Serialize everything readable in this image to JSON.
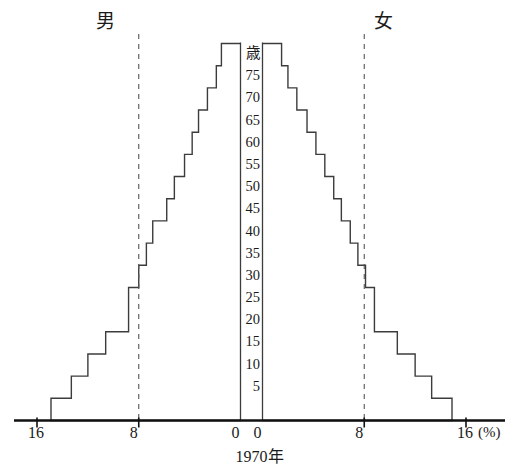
{
  "header": {
    "male_label": "男",
    "female_label": "女"
  },
  "axis": {
    "age_unit_label": "歳",
    "percent_unit_label": "(%)",
    "x_title": "1970年",
    "age_ticks": [
      "歳",
      "75",
      "70",
      "65",
      "60",
      "55",
      "50",
      "45",
      "40",
      "35",
      "30",
      "25",
      "20",
      "15",
      "10",
      "5"
    ],
    "x_tick_labels_left": [
      "16",
      "8",
      "0"
    ],
    "x_tick_labels_right": [
      "0",
      "8",
      "16"
    ],
    "dashed_guide_value": 8,
    "xmax": 16
  },
  "style": {
    "line_color": "#3c3c3c",
    "baseline_color": "#111111",
    "dashed_color": "#555555",
    "background": "#ffffff"
  },
  "chart_data": {
    "type": "bar",
    "orientation": "horizontal",
    "subtype": "population-pyramid",
    "title": "1970年",
    "xlabel": "(%)",
    "ylabel": "歳",
    "xlim": [
      0,
      16
    ],
    "grid": false,
    "legend_position": "top",
    "categories": [
      "80歳以上",
      "75-79",
      "70-74",
      "65-69",
      "60-64",
      "55-59",
      "50-54",
      "45-49",
      "40-44",
      "35-39",
      "30-34",
      "25-29",
      "20-24",
      "15-19",
      "10-14",
      "5-9",
      "0-4"
    ],
    "age_band_starts": [
      80,
      75,
      70,
      65,
      60,
      55,
      50,
      45,
      40,
      35,
      30,
      25,
      20,
      15,
      10,
      5
    ],
    "series": [
      {
        "name": "男",
        "side": "left",
        "values": [
          1.5,
          1.9,
          2.6,
          3.3,
          3.8,
          4.4,
          5.2,
          5.8,
          6.9,
          7.4,
          8.0,
          8.8,
          8.8,
          10.6,
          12.0,
          13.3,
          14.9
        ]
      },
      {
        "name": "女",
        "side": "right",
        "values": [
          1.5,
          2.0,
          2.7,
          3.5,
          4.2,
          4.9,
          5.6,
          6.2,
          6.9,
          7.5,
          8.1,
          8.8,
          8.8,
          10.6,
          12.0,
          13.3,
          14.9
        ]
      }
    ]
  }
}
